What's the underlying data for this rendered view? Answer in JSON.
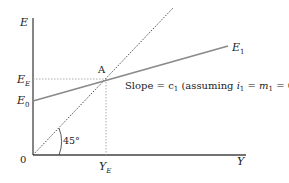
{
  "diagram": {
    "axis_y_label": "E",
    "axis_x_label": "Y",
    "origin_label": "0",
    "ee_label": "E",
    "ee_sub": "E",
    "e0_label": "E",
    "e0_sub": "0",
    "e1_label": "E",
    "e1_sub": "1",
    "point_label": "A",
    "ye_label": "Y",
    "ye_sub": "E",
    "angle_label": "45°",
    "slope_text_1": "Slope = c",
    "slope_sub_c": "1",
    "slope_text_2": " (assuming ",
    "slope_i": "i",
    "slope_sub_i": "1",
    "slope_eq": " = ",
    "slope_m": "m",
    "slope_sub_m": "1",
    "slope_text_3": " = 0)",
    "colors": {
      "axis": "#444444",
      "e_line": "#8a8a8a",
      "dotted": "#333333",
      "guide": "#999999"
    }
  }
}
